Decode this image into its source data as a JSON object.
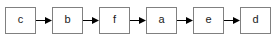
{
  "diagram": {
    "type": "linear-chain",
    "title": "",
    "background_color": "#ffffff",
    "node_border_color": "#808080",
    "node_fill_color": "#ffffff",
    "label_color": "#1a1a1a",
    "arrow_color": "#000000",
    "node_count": 6,
    "arrow_count": 5,
    "nodes": [
      {
        "label": "c",
        "name": "node-c"
      },
      {
        "label": "b",
        "name": "node-b"
      },
      {
        "label": "f",
        "name": "node-f"
      },
      {
        "label": "a",
        "name": "node-a"
      },
      {
        "label": "e",
        "name": "node-e"
      },
      {
        "label": "d",
        "name": "node-d"
      }
    ],
    "connectors": [
      {
        "from": "c",
        "to": "b",
        "direction": "right"
      },
      {
        "from": "b",
        "to": "f",
        "direction": "right"
      },
      {
        "from": "f",
        "to": "a",
        "direction": "right"
      },
      {
        "from": "a",
        "to": "e",
        "direction": "right"
      },
      {
        "from": "e",
        "to": "d",
        "direction": "right"
      }
    ],
    "sequence": "c b f a e d"
  }
}
